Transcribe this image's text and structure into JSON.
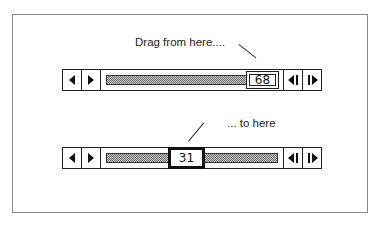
{
  "annotations": {
    "top_caption": "Drag from here....",
    "bottom_caption": "... to here"
  },
  "scrollbars": [
    {
      "id": "before",
      "value": "68",
      "thumb_style": "normal",
      "buttons": [
        "left-arrow",
        "right-arrow",
        "step-back",
        "step-forward"
      ]
    },
    {
      "id": "after",
      "value": "31",
      "thumb_style": "dragging",
      "buttons": [
        "left-arrow",
        "right-arrow",
        "step-back",
        "step-forward"
      ]
    }
  ],
  "colors": {
    "border": "#222222",
    "frame": "#8a8a8a",
    "track_fill": "#9a9a9a",
    "background": "#ffffff"
  }
}
